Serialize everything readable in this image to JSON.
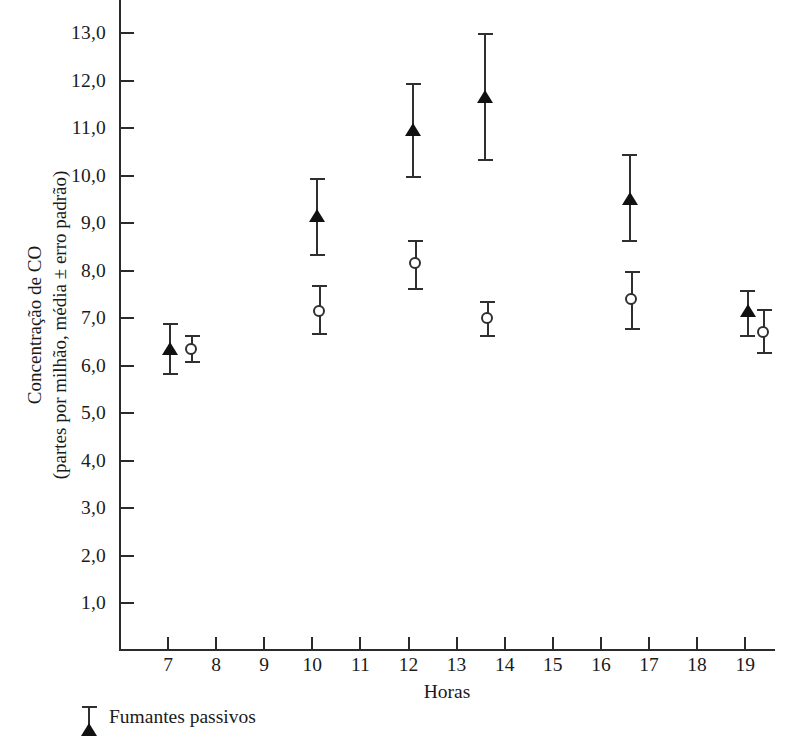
{
  "chart_data": {
    "type": "scatter",
    "title": "",
    "xlabel": "Horas",
    "ylabel": "Concentração de CO\n(partes por milhão, média ± erro padrão)",
    "xlim": [
      6.3,
      19.9
    ],
    "ylim": [
      0.45,
      13.45
    ],
    "grid": false,
    "legend_position": "below-axes-left",
    "xticks": [
      "7",
      "8",
      "9",
      "10",
      "11",
      "12",
      "13",
      "14",
      "15",
      "16",
      "17",
      "18",
      "19"
    ],
    "xtick_values": [
      7,
      8,
      9,
      10,
      11,
      12,
      13,
      14,
      15,
      16,
      17,
      18,
      19
    ],
    "yticks": [
      "1,0",
      "2,0",
      "3,0",
      "4,0",
      "5,0",
      "6,0",
      "7,0",
      "8,0",
      "9,0",
      "10,0",
      "11,0",
      "12,0",
      "13,0"
    ],
    "ytick_values": [
      1,
      2,
      3,
      4,
      5,
      6,
      7,
      8,
      9,
      10,
      11,
      12,
      13
    ],
    "series": [
      {
        "name": "Fumantes passivos",
        "marker": "filled-triangle",
        "points": [
          {
            "x": 7.05,
            "y": 6.35,
            "yerr_low": 5.8,
            "yerr_high": 6.9
          },
          {
            "x": 10.1,
            "y": 9.15,
            "yerr_low": 8.3,
            "yerr_high": 9.95
          },
          {
            "x": 12.1,
            "y": 10.95,
            "yerr_low": 9.95,
            "yerr_high": 11.95
          },
          {
            "x": 13.6,
            "y": 11.65,
            "yerr_low": 10.3,
            "yerr_high": 13.0
          },
          {
            "x": 16.6,
            "y": 9.5,
            "yerr_low": 8.6,
            "yerr_high": 10.45
          },
          {
            "x": 19.05,
            "y": 7.15,
            "yerr_low": 6.6,
            "yerr_high": 7.6
          }
        ]
      },
      {
        "name": "",
        "marker": "open-circle",
        "points": [
          {
            "x": 7.5,
            "y": 6.35,
            "yerr_low": 6.05,
            "yerr_high": 6.65
          },
          {
            "x": 10.15,
            "y": 7.15,
            "yerr_low": 6.65,
            "yerr_high": 7.7
          },
          {
            "x": 12.15,
            "y": 8.15,
            "yerr_low": 7.6,
            "yerr_high": 8.65
          },
          {
            "x": 13.65,
            "y": 7.0,
            "yerr_low": 6.6,
            "yerr_high": 7.35
          },
          {
            "x": 16.65,
            "y": 7.4,
            "yerr_low": 6.75,
            "yerr_high": 8.0
          },
          {
            "x": 19.4,
            "y": 6.7,
            "yerr_low": 6.25,
            "yerr_high": 7.2
          }
        ]
      }
    ],
    "legend": [
      {
        "label": "Fumantes passivos",
        "marker": "filled-triangle"
      }
    ]
  }
}
